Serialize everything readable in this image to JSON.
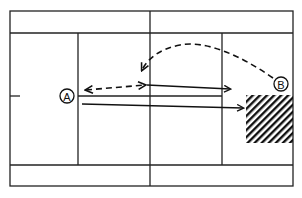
{
  "diagram": {
    "type": "tennis-court-tactics",
    "colors": {
      "line": "#222222",
      "background": "#ffffff",
      "hatch": "#111111"
    },
    "players": [
      {
        "id": "A",
        "label": "A",
        "cx": 67,
        "cy": 96
      },
      {
        "id": "B",
        "label": "B",
        "cx": 281,
        "cy": 84
      }
    ],
    "shots": [
      {
        "id": "volley-exchange",
        "style": "dashed",
        "direction": "both",
        "from": [
          86,
          90
        ],
        "to": [
          145,
          85
        ]
      },
      {
        "id": "lob",
        "style": "dashed-curve",
        "direction": "to-end",
        "from": [
          273,
          78
        ],
        "to": [
          142,
          70
        ]
      },
      {
        "id": "drive-1",
        "style": "solid",
        "direction": "to-end",
        "from": [
          147,
          85
        ],
        "to": [
          230,
          89
        ]
      },
      {
        "id": "drive-2",
        "style": "solid",
        "direction": "to-end",
        "from": [
          82,
          104
        ],
        "to": [
          243,
          108
        ]
      }
    ],
    "target_zone": {
      "pattern": "diagonal-hatch",
      "x": 246,
      "y": 95,
      "width": 47,
      "height": 48
    }
  }
}
